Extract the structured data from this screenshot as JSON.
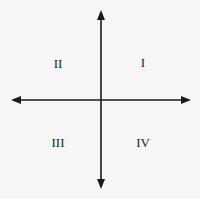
{
  "diagram": {
    "type": "cartesian-quadrants",
    "colors": {
      "background": "#f6f6f6",
      "axis": "#1a1a1a",
      "text": "#222222"
    },
    "axes": {
      "origin": [
        101,
        100
      ],
      "x_axis": {
        "from": [
          11,
          100
        ],
        "to": [
          191,
          100
        ],
        "arrows": "both"
      },
      "y_axis": {
        "from": [
          101,
          10
        ],
        "to": [
          101,
          189
        ],
        "arrows": "both"
      }
    },
    "quadrants": [
      {
        "id": "I",
        "label": "I",
        "position": "top-right"
      },
      {
        "id": "II",
        "label": "II",
        "position": "top-left"
      },
      {
        "id": "III",
        "label": "III",
        "position": "bottom-left"
      },
      {
        "id": "IV",
        "label": "IV",
        "position": "bottom-right"
      }
    ]
  }
}
